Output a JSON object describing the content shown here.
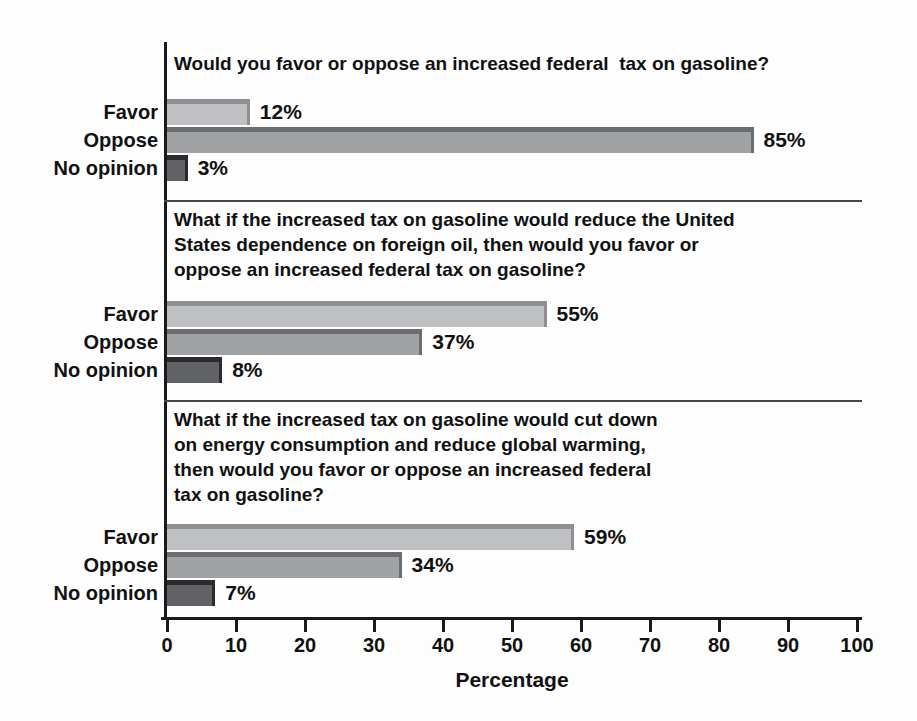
{
  "chart_data": {
    "type": "bar",
    "orientation": "horizontal",
    "xlabel": "Percentage",
    "xlim": [
      0,
      100
    ],
    "xticks": [
      0,
      10,
      20,
      30,
      40,
      50,
      60,
      70,
      80,
      90,
      100
    ],
    "grid": false,
    "legend": false,
    "categories": [
      "Favor",
      "Oppose",
      "No opinion"
    ],
    "series_colors": {
      "favor": {
        "fill": "#bec0c2",
        "edge": "#8d8f92"
      },
      "oppose": {
        "fill": "#a0a2a4",
        "edge": "#6b6d70"
      },
      "no_opinion": {
        "fill": "#616366",
        "edge": "#292b2e"
      }
    },
    "groups": [
      {
        "question": "Would you favor or oppose an increased federal  tax on gasoline?",
        "values": [
          12,
          85,
          3
        ],
        "labels": [
          "12%",
          "85%",
          "3%"
        ]
      },
      {
        "question": "What if the increased tax on gasoline would reduce the United\nStates dependence on foreign oil, then would you favor or\noppose an increased federal tax on gasoline?",
        "values": [
          55,
          37,
          8
        ],
        "labels": [
          "55%",
          "37%",
          "8%"
        ]
      },
      {
        "question": "What if the increased tax on gasoline would cut down\non energy consumption and reduce global warming,\nthen would you favor or oppose an increased federal\ntax on gasoline?",
        "values": [
          59,
          34,
          7
        ],
        "labels": [
          "59%",
          "34%",
          "7%"
        ]
      }
    ]
  }
}
